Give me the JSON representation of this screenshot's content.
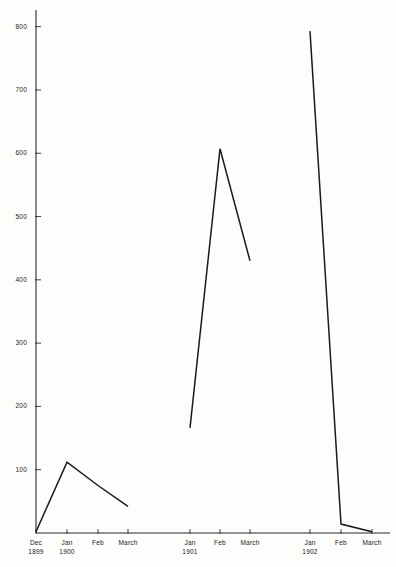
{
  "chart_data": {
    "type": "line",
    "title": "",
    "subtitle": "",
    "xlabel": "",
    "ylabel": "",
    "ylim": [
      0,
      830
    ],
    "yticks": [
      100,
      200,
      300,
      400,
      500,
      600,
      700,
      800
    ],
    "ytick_labels": [
      "100",
      "200",
      "300",
      "400",
      "500",
      "600",
      "700",
      "800"
    ],
    "grid": false,
    "legend": "none",
    "axis_color": "#2b2b2b",
    "line_color": "#1a1a1a",
    "background_color": "#fdfdfc",
    "x_categories": [
      "Dec 1899",
      "Jan 1900",
      "Feb 1900",
      "March 1900",
      "Jan 1901",
      "Feb 1901",
      "March 1901",
      "Jan 1902",
      "Feb 1902",
      "March 1902"
    ],
    "xtick_labels": [
      {
        "month": "Dec",
        "year": "1899"
      },
      {
        "month": "Jan",
        "year": "1900"
      },
      {
        "month": "Feb",
        "year": ""
      },
      {
        "month": "March",
        "year": ""
      },
      {
        "month": "Jan",
        "year": "1901"
      },
      {
        "month": "Feb",
        "year": ""
      },
      {
        "month": "March",
        "year": ""
      },
      {
        "month": "Jan",
        "year": "1902"
      },
      {
        "month": "Feb",
        "year": ""
      },
      {
        "month": "March",
        "year": ""
      }
    ],
    "series": [
      {
        "name": "1899-1900",
        "x": [
          "Dec 1899",
          "Jan 1900",
          "Feb 1900",
          "March 1900"
        ],
        "values": [
          2,
          112,
          75,
          42
        ]
      },
      {
        "name": "1901",
        "x": [
          "Jan 1901",
          "Feb 1901",
          "March 1901"
        ],
        "values": [
          166,
          607,
          430
        ]
      },
      {
        "name": "1902",
        "x": [
          "Jan 1902",
          "Feb 1902",
          "March 1902"
        ],
        "values": [
          793,
          14,
          2
        ]
      }
    ]
  },
  "geometry": {
    "baseline_y": 533,
    "axis_top_y": 10,
    "axis_x": 36,
    "px_per_unit": 0.6329,
    "tick_x_positions": [
      36,
      67,
      98,
      128,
      190,
      220,
      250,
      310,
      341,
      372
    ],
    "axis_right_x": 390
  }
}
